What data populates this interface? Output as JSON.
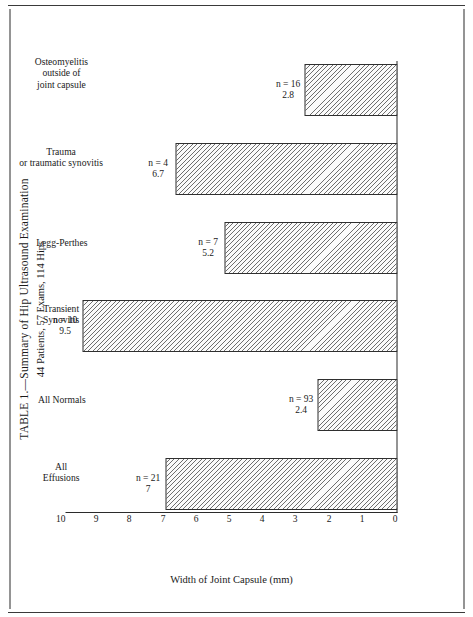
{
  "page": {
    "title": "TABLE 1.—Summary of Hip Ultrasound Examination",
    "subtitle": "44 Patients, 57 Exams, 114 Hips",
    "credit": "(Courtesy of Alexander JE, Seibert JJ, Aronson J, et al: Clin Pediatr (Phila) 27:175–181, April 1988.)"
  },
  "chart_data": {
    "type": "bar",
    "title": "TABLE 1.—Summary of Hip Ultrasound Examination",
    "subtitle": "44 Patients, 57 Exams, 114 Hips",
    "xlabel": "",
    "ylabel": "Width of Joint Capsule (mm)",
    "ylim": [
      0,
      10
    ],
    "yticks": [
      "10",
      "9",
      "8",
      "7",
      "6",
      "5",
      "4",
      "3",
      "2",
      "1",
      "0"
    ],
    "grid": false,
    "legend": "none",
    "orientation": "vertical",
    "categories": [
      "All Effusions",
      "All Normals",
      "Transient Synovitis",
      "Legg-Perthes",
      "Trauma or traumatic synovitis",
      "Osteomyelitis outside of joint capsule"
    ],
    "values": [
      7,
      2.4,
      9.5,
      5.2,
      6.7,
      2.8
    ],
    "counts": [
      21,
      93,
      10,
      7,
      4,
      16
    ],
    "bars": [
      {
        "category": "All Effusions",
        "n_label": "n = 21",
        "value_label": "7",
        "value": 7,
        "n": 21
      },
      {
        "category": "All Normals",
        "n_label": "n = 93",
        "value_label": "2.4",
        "value": 2.4,
        "n": 93
      },
      {
        "category": "Transient Synovitis",
        "n_label": "n = 10",
        "value_label": "9.5",
        "value": 9.5,
        "n": 10
      },
      {
        "category": "Legg-Perthes",
        "n_label": "n = 7",
        "value_label": "5.2",
        "value": 5.2,
        "n": 7
      },
      {
        "category": "Trauma or traumatic synovitis",
        "n_label": "n = 4",
        "value_label": "6.7",
        "value": 6.7,
        "n": 4
      },
      {
        "category": "Osteomyelitis outside of joint capsule",
        "n_label": "n = 16",
        "value_label": "2.8",
        "value": 2.8,
        "n": 16
      }
    ]
  }
}
